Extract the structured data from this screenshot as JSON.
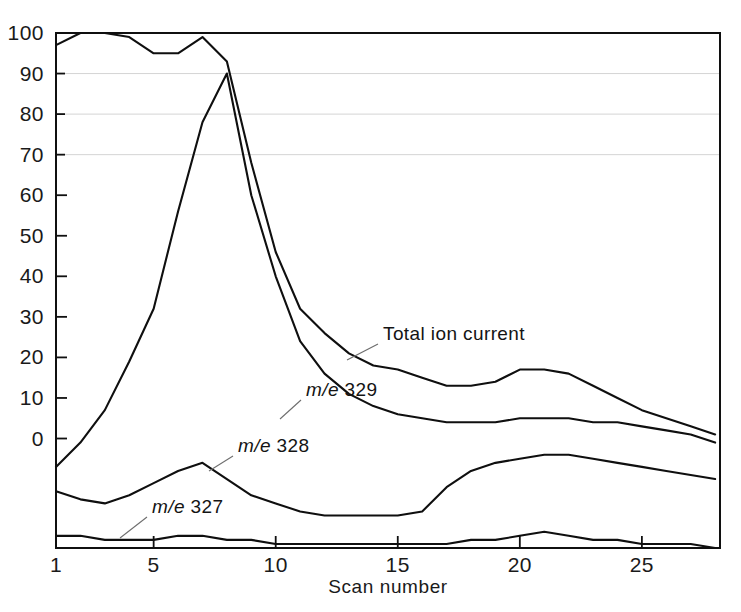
{
  "figure": {
    "title": "",
    "background": "#ffffff",
    "ink_color": "#101010",
    "grid_color": "#c9c9c9"
  },
  "axes": {
    "x_title": "Scan number",
    "y_title": "",
    "x_tick_labels": [
      "1",
      "5",
      "10",
      "15",
      "20",
      "25"
    ],
    "x_tick_values": [
      1,
      5,
      10,
      15,
      20,
      25
    ],
    "y_tick_labels": [
      "0",
      "10",
      "20",
      "30",
      "40",
      "50",
      "60",
      "70",
      "80",
      "90",
      "100"
    ],
    "y_tick_values": [
      0,
      10,
      20,
      30,
      40,
      50,
      60,
      70,
      80,
      90,
      100
    ],
    "x_range": [
      1,
      28.2
    ],
    "y_range": [
      -27,
      100
    ],
    "gridlines_at": [
      70,
      80,
      90,
      100
    ]
  },
  "annotations": [
    {
      "id": "total-ion-current",
      "text": "Total ion current",
      "x": 383,
      "y": 340
    },
    {
      "id": "me-329",
      "text": "m/e 329",
      "prefix": "m/e",
      "value": "329",
      "x": 306,
      "y": 396
    },
    {
      "id": "me-328",
      "text": "m/e 328",
      "prefix": "m/e",
      "value": "328",
      "x": 238,
      "y": 452
    },
    {
      "id": "me-327",
      "text": "m/e 327",
      "prefix": "m/e",
      "value": "327",
      "x": 152,
      "y": 513
    }
  ],
  "chart_data": {
    "type": "line",
    "title": "",
    "xlabel": "Scan number",
    "ylabel": "",
    "xlim": [
      1,
      28.2
    ],
    "ylim": [
      -27,
      100
    ],
    "grid": true,
    "legend": "inline-annotations",
    "x": [
      1,
      2,
      3,
      4,
      5,
      6,
      7,
      8,
      9,
      10,
      11,
      12,
      13,
      14,
      15,
      16,
      17,
      18,
      19,
      20,
      21,
      22,
      23,
      24,
      25,
      26,
      27,
      28
    ],
    "series": [
      {
        "name": "Total ion current",
        "label": "Total ion current",
        "values": [
          97,
          100,
          100,
          99,
          95,
          95,
          99,
          93,
          68,
          46,
          32,
          26,
          21,
          18,
          17,
          15,
          13,
          13,
          14,
          17,
          17,
          16,
          13,
          10,
          7,
          5,
          3,
          1
        ]
      },
      {
        "name": "m/e 329",
        "label": "m/e 329",
        "values": [
          -7,
          -1,
          7,
          19,
          32,
          56,
          78,
          90,
          60,
          40,
          24,
          16,
          11,
          8,
          6,
          5,
          4,
          4,
          4,
          5,
          5,
          5,
          4,
          4,
          3,
          2,
          1,
          -1
        ]
      },
      {
        "name": "m/e 328",
        "label": "m/e 328",
        "values": [
          -13,
          -15,
          -16,
          -14,
          -11,
          -8,
          -6,
          -10,
          -14,
          -16,
          -18,
          -19,
          -19,
          -19,
          -19,
          -18,
          -12,
          -8,
          -6,
          -5,
          -4,
          -4,
          -5,
          -6,
          -7,
          -8,
          -9,
          -10
        ]
      },
      {
        "name": "m/e 327",
        "label": "m/e 327",
        "values": [
          -24,
          -24,
          -25,
          -25,
          -25,
          -24,
          -24,
          -25,
          -25,
          -26,
          -26,
          -26,
          -26,
          -26,
          -26,
          -26,
          -26,
          -25,
          -25,
          -24,
          -23,
          -24,
          -25,
          -25,
          -26,
          -26,
          -26,
          -27
        ]
      }
    ]
  }
}
